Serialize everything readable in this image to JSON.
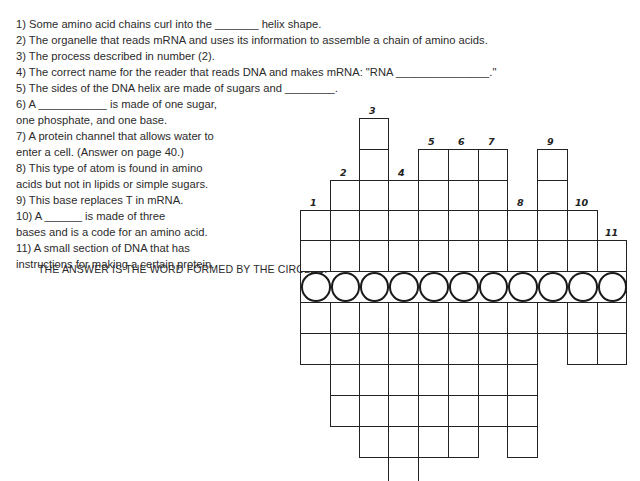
{
  "clues": [
    "1) Some amino acid chains curl into the _______ helix shape.",
    "2) The organelle that reads mRNA and uses its information to assemble a chain of amino acids.",
    "3) The process described in number (2).",
    "4) The correct name for the reader that reads DNA and makes mRNA:  \"RNA _______________.\"",
    "5) The sides of the DNA helix are made of sugars and ________.",
    " 6) A ___________ is made of one sugar,",
    "one phosphate, and one base.",
    "7) A protein channel that allows water to",
    " enter a cell.  (Answer on page 40.)",
    "8) This type of atom is found in amino",
    "acids but not in lipids or simple sugars.",
    "9) This base replaces T in mRNA.",
    "10) A ______ is made of three",
    "bases and is a code for an amino acid.",
    "11) A small section of DNA that has",
    "instructions for making a certain protein."
  ],
  "answer_label": "THE ANSWER IS THE WORD FORMED BY THE CIRCLES:",
  "grid": {
    "col_x": [
      300,
      330,
      359,
      388,
      418,
      448,
      478,
      507,
      537,
      567,
      597,
      626
    ],
    "numbers": [
      {
        "n": "1",
        "col": 0
      },
      {
        "n": "2",
        "col": 1
      },
      {
        "n": "3",
        "col": 2
      },
      {
        "n": "4",
        "col": 3
      },
      {
        "n": "5",
        "col": 4
      },
      {
        "n": "6",
        "col": 5
      },
      {
        "n": "7",
        "col": 6
      },
      {
        "n": "8",
        "col": 7
      },
      {
        "n": "9",
        "col": 8
      },
      {
        "n": "10",
        "col": 9
      },
      {
        "n": "11",
        "col": 10
      }
    ],
    "circle_count": 11
  }
}
